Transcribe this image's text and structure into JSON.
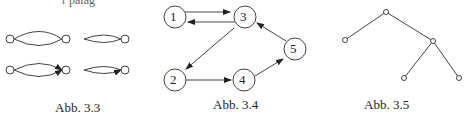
{
  "top_fragment": "r palag",
  "figures": [
    {
      "id": "fig33",
      "caption": "Abb. 3.3"
    },
    {
      "id": "fig34",
      "caption": "Abb. 3.4",
      "nodes": [
        "1",
        "2",
        "3",
        "4",
        "5"
      ],
      "edges": [
        [
          "1",
          "3"
        ],
        [
          "3",
          "1"
        ],
        [
          "3",
          "2"
        ],
        [
          "2",
          "4"
        ],
        [
          "4",
          "5"
        ],
        [
          "5",
          "3"
        ]
      ]
    },
    {
      "id": "fig35",
      "caption": "Abb. 3.5"
    }
  ]
}
